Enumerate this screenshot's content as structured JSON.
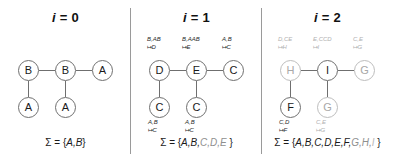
{
  "figure": {
    "panels": [
      {
        "title_var": "i",
        "title_eq": "= 0",
        "nodes": [
          {
            "id": "n0",
            "label": "B",
            "x": 18,
            "y": 60,
            "gray": false
          },
          {
            "id": "n1",
            "label": "B",
            "x": 55,
            "y": 60,
            "gray": false
          },
          {
            "id": "n2",
            "label": "A",
            "x": 92,
            "y": 60,
            "gray": false
          },
          {
            "id": "n3",
            "label": "A",
            "x": 18,
            "y": 97,
            "gray": false
          },
          {
            "id": "n4",
            "label": "A",
            "x": 55,
            "y": 97,
            "gray": false
          }
        ],
        "top_rules": [],
        "bottom_rules": [],
        "sigma_prefix": "Σ = {",
        "sigma_black": "A,B",
        "sigma_gray1": "",
        "sigma_gray2": "",
        "sigma_suffix": "}"
      },
      {
        "title_var": "i",
        "title_eq": "= 1",
        "nodes": [
          {
            "id": "n0",
            "label": "D",
            "x": 18,
            "y": 60,
            "gray": false
          },
          {
            "id": "n1",
            "label": "E",
            "x": 55,
            "y": 60,
            "gray": false
          },
          {
            "id": "n2",
            "label": "C",
            "x": 92,
            "y": 60,
            "gray": false
          },
          {
            "id": "n3",
            "label": "C",
            "x": 18,
            "y": 97,
            "gray": false
          },
          {
            "id": "n4",
            "label": "C",
            "x": 55,
            "y": 97,
            "gray": false
          }
        ],
        "top_rules": [
          {
            "lhs": "B,AB",
            "rhs": "D",
            "x": 16,
            "y": 36,
            "gray": false
          },
          {
            "lhs": "B,AAB",
            "rhs": "E",
            "x": 51,
            "y": 36,
            "gray": false
          },
          {
            "lhs": "A,B",
            "rhs": "C",
            "x": 91,
            "y": 36,
            "gray": false
          }
        ],
        "bottom_rules": [
          {
            "lhs": "A,B",
            "rhs": "C",
            "x": 17,
            "y": 119,
            "gray": false
          },
          {
            "lhs": "A,B",
            "rhs": "C",
            "x": 54,
            "y": 119,
            "gray": false
          }
        ],
        "sigma_prefix": "Σ = {",
        "sigma_black": "A,B,",
        "sigma_gray1": "C,D,E",
        "sigma_gray2": "",
        "sigma_suffix": " }"
      },
      {
        "title_var": "i",
        "title_eq": "= 2",
        "nodes": [
          {
            "id": "n0",
            "label": "H",
            "x": 18,
            "y": 60,
            "gray": true
          },
          {
            "id": "n1",
            "label": "I",
            "x": 55,
            "y": 60,
            "gray": false
          },
          {
            "id": "n2",
            "label": "G",
            "x": 92,
            "y": 60,
            "gray": true
          },
          {
            "id": "n3",
            "label": "F",
            "x": 18,
            "y": 97,
            "gray": false
          },
          {
            "id": "n4",
            "label": "G",
            "x": 55,
            "y": 97,
            "gray": true
          }
        ],
        "top_rules": [
          {
            "lhs": "D,CE",
            "rhs": "H",
            "x": 16,
            "y": 36,
            "gray": true
          },
          {
            "lhs": "E,CCD",
            "rhs": "I",
            "x": 51,
            "y": 36,
            "gray": true
          },
          {
            "lhs": "C,E",
            "rhs": "G",
            "x": 91,
            "y": 36,
            "gray": true
          }
        ],
        "bottom_rules": [
          {
            "lhs": "C,D",
            "rhs": "F",
            "x": 17,
            "y": 119,
            "gray": false
          },
          {
            "lhs": "C,E",
            "rhs": "G",
            "x": 54,
            "y": 119,
            "gray": true
          }
        ],
        "sigma_prefix": "Σ = {",
        "sigma_black": "A,B,C,D,E,F,",
        "sigma_gray1": "G,H,",
        "sigma_gray2": "I",
        "sigma_suffix": " }"
      }
    ],
    "edges": [
      {
        "type": "h",
        "x": 39,
        "y": 70,
        "len": 16
      },
      {
        "type": "h",
        "x": 76,
        "y": 70,
        "len": 16
      },
      {
        "type": "v",
        "x": 28,
        "y": 81,
        "len": 16
      },
      {
        "type": "v",
        "x": 65,
        "y": 81,
        "len": 16
      }
    ],
    "arrow_glyph": "↦"
  }
}
